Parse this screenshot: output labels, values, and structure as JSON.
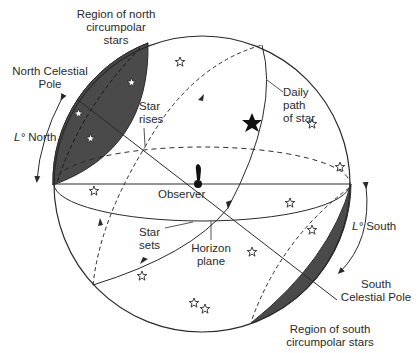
{
  "diagram": {
    "colors": {
      "shade": "#4a4a4a",
      "line": "#2a2a2a",
      "background": "#ffffff"
    },
    "labels": {
      "north_circumpolar": [
        "Region of north",
        "circumpolar",
        "stars"
      ],
      "north_pole": [
        "North Celestial",
        "Pole"
      ],
      "latitude_north_symbol": "L°",
      "latitude_north_word": "North",
      "star_rises": [
        "Star",
        "rises"
      ],
      "daily_path": [
        "Daily",
        "path",
        "of star"
      ],
      "observer": "Observer",
      "star_sets": [
        "Star",
        "sets"
      ],
      "horizon_plane": [
        "Horizon",
        "plane"
      ],
      "latitude_south_symbol": "L°",
      "latitude_south_word": "South",
      "south_pole": [
        "South",
        "Celestial Pole"
      ],
      "south_circumpolar": [
        "Region of south",
        "circumpolar stars"
      ]
    }
  }
}
